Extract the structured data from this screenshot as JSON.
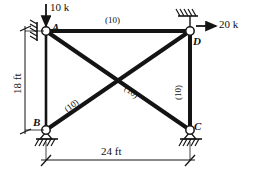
{
  "figure": {
    "type": "truss-free-body-diagram",
    "stroke_color": "#141414",
    "background": "#ffffff"
  },
  "nodes": [
    {
      "id": "A",
      "label": "A",
      "x": 46,
      "y": 31,
      "support": "wall-hatched-left",
      "label_x": 52,
      "label_y": 24
    },
    {
      "id": "D",
      "label": "D",
      "x": 190,
      "y": 31,
      "support": "wall-hatched-top",
      "label_x": 193,
      "label_y": 38
    },
    {
      "id": "B",
      "label": "B",
      "x": 46,
      "y": 130,
      "support": "pin-ground-hatched",
      "label_x": 35,
      "label_y": 120
    },
    {
      "id": "C",
      "label": "C",
      "x": 190,
      "y": 130,
      "support": "pin-ground-hatched",
      "label_x": 193,
      "label_y": 122
    }
  ],
  "members": [
    {
      "id": "AD",
      "from": "A",
      "to": "D",
      "label": "(10)",
      "thick": true,
      "label_x": 105,
      "label_y": 16,
      "rotation": "none"
    },
    {
      "id": "DC",
      "from": "D",
      "to": "C",
      "label": "(10)",
      "thick": true,
      "label_x": 174,
      "label_y": 93,
      "rotation": "vertical"
    },
    {
      "id": "AC",
      "from": "A",
      "to": "C",
      "label": "(10)",
      "thick": true,
      "label_x": 130,
      "label_y": 88,
      "rotation": "diag-down"
    },
    {
      "id": "BD",
      "from": "B",
      "to": "D",
      "label": "(10)",
      "thick": true,
      "label_x": 64,
      "label_y": 107,
      "rotation": "diag-up"
    },
    {
      "id": "AB",
      "from": "A",
      "to": "B",
      "label": "",
      "thick": false,
      "label_x": 0,
      "label_y": 0,
      "rotation": "none"
    }
  ],
  "loads": [
    {
      "id": "load-A",
      "label": "10 k",
      "direction": "down",
      "label_x": 50,
      "label_y": 3
    },
    {
      "id": "load-D",
      "label": "20 k",
      "direction": "right",
      "label_x": 218,
      "label_y": 21
    }
  ],
  "dimensions": [
    {
      "id": "height-dim",
      "label": "18 ft",
      "orientation": "vertical",
      "label_x": 10,
      "label_y": 96
    },
    {
      "id": "width-dim",
      "label": "24 ft",
      "orientation": "horizontal",
      "label_x": 103,
      "label_y": 149
    }
  ]
}
